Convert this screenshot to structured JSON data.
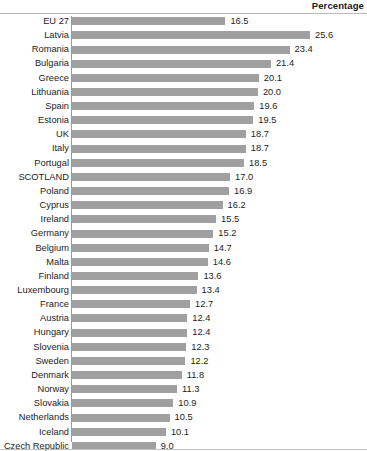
{
  "header": {
    "title": "Percentage"
  },
  "chart_data": {
    "type": "bar",
    "orientation": "horizontal",
    "title": "",
    "subtitle": "",
    "xlabel": "Percentage",
    "ylabel": "",
    "grid": false,
    "legend": false,
    "xlim": [
      0,
      25.6
    ],
    "value_format": "one-decimal",
    "bar_color": "#a0a0a0",
    "categories": [
      "EU 27",
      "Latvia",
      "Romania",
      "Bulgaria",
      "Greece",
      "Lithuania",
      "Spain",
      "Estonia",
      "UK",
      "Italy",
      "Portugal",
      "SCOTLAND",
      "Poland",
      "Cyprus",
      "Ireland",
      "Germany",
      "Belgium",
      "Malta",
      "Finland",
      "Luxembourg",
      "France",
      "Austria",
      "Hungary",
      "Slovenia",
      "Sweden",
      "Denmark",
      "Norway",
      "Slovakia",
      "Netherlands",
      "Iceland",
      "Czech Republic"
    ],
    "values": [
      16.5,
      25.6,
      23.4,
      21.4,
      20.1,
      20.0,
      19.6,
      19.5,
      18.7,
      18.7,
      18.5,
      17.0,
      16.9,
      16.2,
      15.5,
      15.2,
      14.7,
      14.6,
      13.6,
      13.4,
      12.7,
      12.4,
      12.4,
      12.3,
      12.2,
      11.8,
      11.3,
      10.9,
      10.5,
      10.1,
      9.0
    ],
    "value_labels": [
      "16.5",
      "25.6",
      "23.4",
      "21.4",
      "20.1",
      "20.0",
      "19.6",
      "19.5",
      "18.7",
      "18.7",
      "18.5",
      "17.0",
      "16.9",
      "16.2",
      "15.5",
      "15.2",
      "14.7",
      "14.6",
      "13.6",
      "13.4",
      "12.7",
      "12.4",
      "12.4",
      "12.3",
      "12.2",
      "11.8",
      "11.3",
      "10.9",
      "10.5",
      "10.1",
      "9.0"
    ]
  }
}
